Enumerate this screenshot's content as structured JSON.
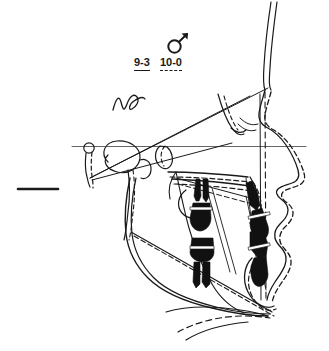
{
  "document": {
    "type": "cephalometric-superimposition-tracing",
    "background_color": "#ffffff",
    "ink_color": "#1a1a1a",
    "width": 329,
    "height": 351
  },
  "legend": {
    "sex_symbol": {
      "name": "male-symbol",
      "glyph": "♂"
    },
    "entries": [
      {
        "label": "9-3",
        "line_style": "solid"
      },
      {
        "label": "10-0",
        "line_style": "dashed"
      }
    ]
  },
  "annotations": {
    "scribble": {
      "name": "handwritten-squiggle"
    },
    "scale_bar": {
      "name": "scale-reference-dash"
    },
    "horizontal_plane": {
      "name": "frankfort-horizontal-line"
    }
  },
  "tracing": {
    "structures": [
      "cranial-base",
      "sella-turcica",
      "porion",
      "forehead-profile",
      "nasal-profile",
      "upper-lip",
      "lower-lip",
      "chin-soft-tissue",
      "maxilla",
      "palatal-plane",
      "mandible",
      "mandibular-ramus",
      "gonial-angle",
      "symphysis",
      "upper-incisor",
      "lower-incisor",
      "upper-molar",
      "lower-molar",
      "hyoid-outline"
    ]
  }
}
